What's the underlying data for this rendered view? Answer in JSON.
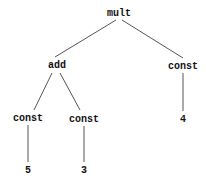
{
  "tree": {
    "nodes": [
      {
        "id": "root",
        "label": "mult",
        "x": 119,
        "y": 13
      },
      {
        "id": "add",
        "label": "add",
        "x": 57,
        "y": 65
      },
      {
        "id": "const_r",
        "label": "const",
        "x": 183,
        "y": 66
      },
      {
        "id": "const_l",
        "label": "const",
        "x": 28,
        "y": 118
      },
      {
        "id": "const_m",
        "label": "const",
        "x": 84,
        "y": 119
      },
      {
        "id": "v5",
        "label": "5",
        "x": 28,
        "y": 170
      },
      {
        "id": "v3",
        "label": "3",
        "x": 84,
        "y": 170
      },
      {
        "id": "v4",
        "label": "4",
        "x": 183,
        "y": 119
      }
    ],
    "edges": [
      [
        "root",
        "add"
      ],
      [
        "root",
        "const_r"
      ],
      [
        "add",
        "const_l"
      ],
      [
        "add",
        "const_m"
      ],
      [
        "const_l",
        "v5"
      ],
      [
        "const_m",
        "v3"
      ],
      [
        "const_r",
        "v4"
      ]
    ]
  }
}
